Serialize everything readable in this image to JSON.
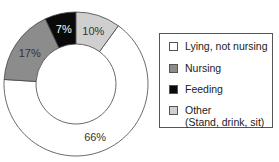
{
  "chart_data": {
    "type": "pie",
    "subtype": "donut",
    "title": "",
    "categories": [
      "Lying, not nursing",
      "Nursing",
      "Feeding",
      "Other (Stand, drink, sit)"
    ],
    "values": [
      66,
      17,
      7,
      10
    ],
    "labels": [
      "66%",
      "17%",
      "7%",
      "10%"
    ],
    "colors": [
      "#ffffff",
      "#8c8c8c",
      "#0a0a0a",
      "#cfcfcf"
    ],
    "legend_position": "right"
  },
  "legend": {
    "items": [
      {
        "label": "Lying, not nursing",
        "color": "#ffffff"
      },
      {
        "label": "Nursing",
        "color": "#8c8c8c"
      },
      {
        "label": "Feeding",
        "color": "#0a0a0a"
      },
      {
        "label": "Other",
        "label2": "(Stand, drink, sit)",
        "color": "#cfcfcf"
      }
    ]
  }
}
